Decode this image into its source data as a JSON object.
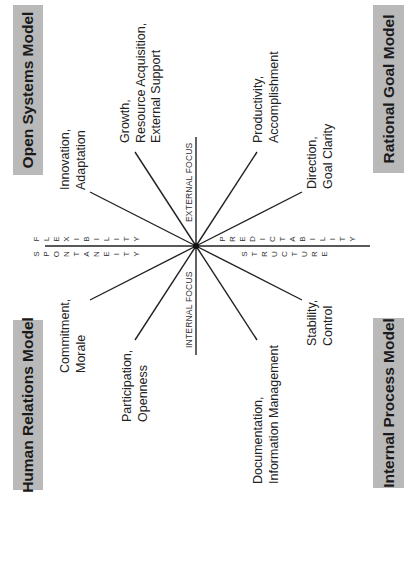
{
  "models": {
    "open_systems": "Open Systems Model",
    "rational_goal": "Rational Goal Model",
    "human_relations": "Human Relations Model",
    "internal_process": "Internal Process Model"
  },
  "axes": {
    "external_focus": "EXTERNAL FOCUS",
    "internal_focus": "INTERNAL FOCUS",
    "flexibility": [
      "F",
      "L",
      "E",
      "X",
      "I",
      "B",
      "I",
      "L",
      "I",
      "T",
      "Y"
    ],
    "spontaneity": [
      "S",
      "P",
      "O",
      "N",
      "T",
      "A",
      "N",
      "E",
      "I",
      "T",
      "Y"
    ],
    "predictability": [
      "P",
      "R",
      "E",
      "D",
      "I",
      "C",
      "T",
      "A",
      "B",
      "I",
      "L",
      "I",
      "T",
      "Y"
    ],
    "structure": [
      "S",
      "T",
      "R",
      "U",
      "C",
      "T",
      "U",
      "R",
      "E"
    ]
  },
  "spokes": {
    "innovation": [
      "Innovation,",
      "Adaptation"
    ],
    "growth": [
      "Growth,",
      "Resource Acquisition,",
      "External Support"
    ],
    "productivity": [
      "Productivity,",
      "Accomplishment"
    ],
    "direction": [
      "Direction,",
      "Goal Clarity"
    ],
    "commitment": [
      "Commitment,",
      "Morale"
    ],
    "participation": [
      "Participation,",
      "Openness"
    ],
    "documentation": [
      "Documentation,",
      "Information Management"
    ],
    "stability": [
      "Stability,",
      "Control"
    ]
  },
  "colors": {
    "box_fill": "#b9b9b9",
    "line": "#222222",
    "text": "#222222"
  }
}
